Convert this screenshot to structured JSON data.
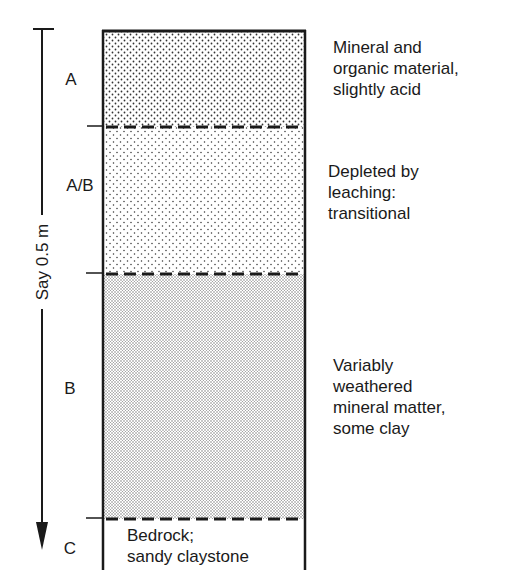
{
  "diagram": {
    "type": "soil-profile",
    "scale": {
      "label": "Say 0.5 m",
      "direction": "downward-arrow"
    },
    "horizons": [
      {
        "id": "A",
        "label": "A",
        "description": "Mineral and\norganic material,\nslightly acid",
        "texture": "coarse-stipple"
      },
      {
        "id": "AB",
        "label": "A/B",
        "description": "Depleted by\nleaching:\ntransitional",
        "texture": "sparse-stipple"
      },
      {
        "id": "B",
        "label": "B",
        "description": "Variably\nweathered\nmineral matter,\nsome clay",
        "texture": "fine-stipple"
      },
      {
        "id": "C",
        "label": "C",
        "description": "Bedrock;\nsandy claystone",
        "texture": "none"
      }
    ],
    "colors": {
      "ink": "#1a1a1a",
      "background": "#ffffff"
    }
  }
}
